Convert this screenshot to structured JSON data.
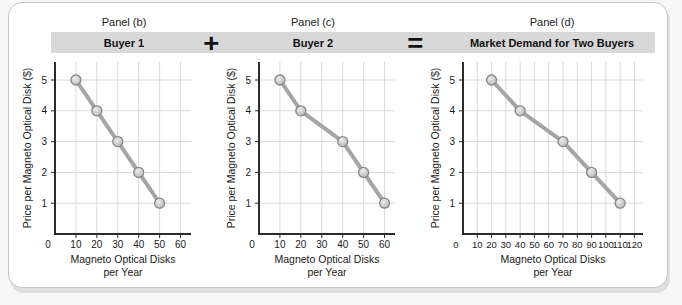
{
  "panels": [
    {
      "panel_label": "Panel (b)",
      "header": "Buyer 1"
    },
    {
      "panel_label": "Panel (c)",
      "header": "Buyer 2"
    },
    {
      "panel_label": "Panel (d)",
      "header": "Market Demand for Two Buyers"
    }
  ],
  "operators": {
    "plus": "+",
    "equals": "="
  },
  "style": {
    "bar_bg": "#d8d8d8",
    "line_color": "#a5a5a5",
    "marker_fill": "#b9b9b9",
    "marker_highlight": "#ebebeb",
    "marker_stroke": "#878787",
    "grid_color": "#d9d9d9",
    "axis_color": "#2b2b2b",
    "text_color": "#1a1a1a"
  },
  "chart_data": [
    {
      "type": "line",
      "title": "Buyer 1",
      "x": [
        10,
        20,
        30,
        40,
        50
      ],
      "y": [
        5,
        4,
        3,
        2,
        1
      ],
      "xticks": [
        0,
        10,
        20,
        30,
        40,
        50,
        60
      ],
      "yticks": [
        1,
        2,
        3,
        4,
        5
      ],
      "xlim": [
        0,
        65
      ],
      "ylim": [
        0,
        5
      ],
      "xlabel_line1": "Magneto Optical Disks",
      "xlabel_line2": "per Year",
      "ylabel": "Price per Magneto Optical Disk ($)",
      "grid": "on",
      "legend": "none"
    },
    {
      "type": "line",
      "title": "Buyer 2",
      "x": [
        10,
        20,
        40,
        50,
        60
      ],
      "y": [
        5,
        4,
        3,
        2,
        1
      ],
      "xticks": [
        0,
        10,
        20,
        30,
        40,
        50,
        60
      ],
      "yticks": [
        1,
        2,
        3,
        4,
        5
      ],
      "xlim": [
        0,
        65
      ],
      "ylim": [
        0,
        5
      ],
      "xlabel_line1": "Magneto Optical Disks",
      "xlabel_line2": "per Year",
      "ylabel": "Price per Magneto Optical Disk ($)",
      "grid": "on",
      "legend": "none"
    },
    {
      "type": "line",
      "title": "Market Demand for Two Buyers",
      "x": [
        20,
        40,
        70,
        90,
        110
      ],
      "y": [
        5,
        4,
        3,
        2,
        1
      ],
      "xticks": [
        0,
        10,
        20,
        30,
        40,
        50,
        60,
        70,
        80,
        90,
        100,
        110,
        120
      ],
      "yticks": [
        1,
        2,
        3,
        4,
        5
      ],
      "xlim": [
        0,
        126
      ],
      "ylim": [
        0,
        5
      ],
      "xlabel_line1": "Magneto Optical Disks",
      "xlabel_line2": "per Year",
      "ylabel": "Price per Magneto Optical Disk ($)",
      "grid": "on",
      "legend": "none"
    }
  ]
}
